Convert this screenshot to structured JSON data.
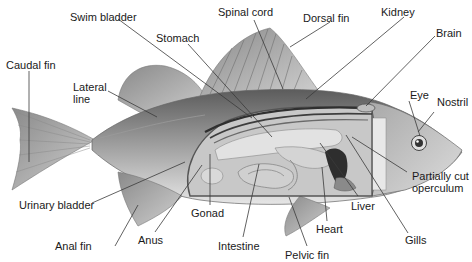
{
  "diagram": {
    "labels": {
      "swim_bladder": "Swim bladder",
      "spinal_cord": "Spinal cord",
      "dorsal_fin": "Dorsal fin",
      "kidney": "Kidney",
      "brain": "Brain",
      "stomach": "Stomach",
      "caudal_fin": "Caudal fin",
      "lateral_line_1": "Lateral",
      "lateral_line_2": "line",
      "eye": "Eye",
      "nostril": "Nostril",
      "partially_cut_operculum_1": "Partially cut",
      "partially_cut_operculum_2": "operculum",
      "urinary_bladder": "Urinary bladder",
      "gonad": "Gonad",
      "liver": "Liver",
      "anal_fin": "Anal fin",
      "anus": "Anus",
      "heart": "Heart",
      "gills": "Gills",
      "intestine": "Intestine",
      "pelvic_fin": "Pelvic fin"
    },
    "colors": {
      "line": "#3a3a3a",
      "body_dark": "#6e6e6e",
      "body_light": "#d8d8d8",
      "cavity": "#bdbdbd"
    }
  }
}
